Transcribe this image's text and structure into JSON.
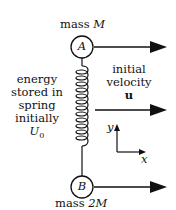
{
  "labels": {
    "mass_top": "mass",
    "mass_top_var": "M",
    "mass_bottom": "mass",
    "mass_bottom_var": "2M",
    "circle_top": "A",
    "circle_bottom": "B",
    "energy_line1": "energy",
    "energy_line2": "stored in",
    "energy_line3": "spring",
    "energy_line4": "initially",
    "energy_var": "U",
    "energy_sub": "0",
    "velocity_line1": "initial",
    "velocity_line2": "velocity",
    "velocity_var": "u",
    "axis_y": "y",
    "axis_x": "x"
  },
  "colors": {
    "ink": "#111111"
  }
}
